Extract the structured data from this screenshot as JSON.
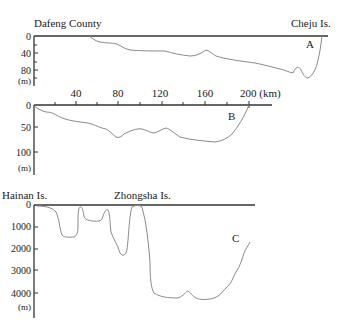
{
  "profiles": {
    "A": {
      "label": "A",
      "left_place": "Dafeng County",
      "right_place": "Cheju Is.",
      "y_ticks": [
        "0",
        "40",
        "80"
      ],
      "y_unit": "(m)"
    },
    "B": {
      "label": "B",
      "y_ticks": [
        "0",
        "50",
        "100"
      ],
      "y_unit": "(m)"
    },
    "C": {
      "label": "C",
      "left_place": "Hainan Is.",
      "middle_place": "Zhongsha Is.",
      "y_ticks": [
        "0",
        "1000",
        "2000",
        "3000",
        "4000"
      ],
      "y_unit": "(m)"
    }
  },
  "distance_scale": {
    "ticks": [
      "40",
      "80",
      "120",
      "160",
      "200 (km)"
    ]
  }
}
